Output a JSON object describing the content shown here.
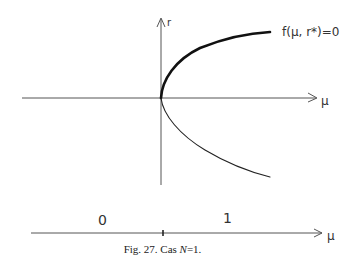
{
  "figure": {
    "top_plot": {
      "vertical_axis_label": "r",
      "horizontal_axis_label": "μ",
      "curve_label": "f(μ, r*)=0"
    },
    "bottom_line": {
      "axis_label": "μ",
      "region_left_label": "0",
      "region_right_label": "1"
    },
    "caption": {
      "prefix": "Fig. 27. Cas ",
      "variable": "N",
      "suffix": "=1."
    }
  }
}
